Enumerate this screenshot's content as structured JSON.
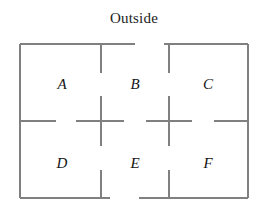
{
  "figure": {
    "type": "floor-plan-diagram",
    "width": 268,
    "height": 212,
    "background_color": "#ffffff",
    "title": "Outside",
    "wall_color": "#808080",
    "label_color": "#141414",
    "wall_thickness": 1.4
  },
  "rooms": [
    {
      "id": "A",
      "label": "A",
      "cx": 62,
      "cy": 84,
      "row": "top",
      "column": "left"
    },
    {
      "id": "B",
      "label": "B",
      "cx": 135,
      "cy": 84,
      "row": "top",
      "column": "center"
    },
    {
      "id": "C",
      "label": "C",
      "cx": 208,
      "cy": 84,
      "row": "top",
      "column": "right"
    },
    {
      "id": "D",
      "label": "D",
      "cx": 62,
      "cy": 163,
      "row": "bottom",
      "column": "left"
    },
    {
      "id": "E",
      "label": "E",
      "cx": 135,
      "cy": 163,
      "row": "bottom",
      "column": "center"
    },
    {
      "id": "F",
      "label": "F",
      "cx": 208,
      "cy": 163,
      "row": "bottom",
      "column": "right"
    }
  ],
  "geometry": {
    "outer_left": 20,
    "outer_right": 248,
    "outer_top": 44,
    "outer_bottom": 198,
    "divider_x_1": 101,
    "divider_x_2": 169,
    "divider_y": 121
  },
  "walls": [
    {
      "name": "outer-wall-left",
      "orientation": "vertical",
      "x1": 20,
      "y1": 44,
      "x2": 20,
      "y2": 198
    },
    {
      "name": "outer-wall-right",
      "orientation": "vertical",
      "x1": 248,
      "y1": 44,
      "x2": 248,
      "y2": 198
    },
    {
      "name": "outer-wall-top-left",
      "orientation": "horizontal",
      "x1": 20,
      "y1": 44,
      "x2": 135,
      "y2": 44
    },
    {
      "name": "outer-wall-top-right",
      "orientation": "horizontal",
      "x1": 164,
      "y1": 44,
      "x2": 248,
      "y2": 44
    },
    {
      "name": "outer-wall-bottom-left",
      "orientation": "horizontal",
      "x1": 20,
      "y1": 198,
      "x2": 110,
      "y2": 198
    },
    {
      "name": "outer-wall-bottom-right",
      "orientation": "horizontal",
      "x1": 139,
      "y1": 198,
      "x2": 248,
      "y2": 198
    },
    {
      "name": "inner-wall-mid-segment-1",
      "orientation": "horizontal",
      "x1": 20,
      "y1": 121,
      "x2": 56,
      "y2": 121
    },
    {
      "name": "inner-wall-mid-segment-2",
      "orientation": "horizontal",
      "x1": 76,
      "y1": 121,
      "x2": 124,
      "y2": 121
    },
    {
      "name": "inner-wall-mid-segment-3",
      "orientation": "horizontal",
      "x1": 146,
      "y1": 121,
      "x2": 192,
      "y2": 121
    },
    {
      "name": "inner-wall-mid-segment-4",
      "orientation": "horizontal",
      "x1": 214,
      "y1": 121,
      "x2": 248,
      "y2": 121
    },
    {
      "name": "inner-wall-ab-upper",
      "orientation": "vertical",
      "x1": 101,
      "y1": 44,
      "x2": 101,
      "y2": 73
    },
    {
      "name": "inner-wall-ab-lower",
      "orientation": "vertical",
      "x1": 101,
      "y1": 96,
      "x2": 101,
      "y2": 146
    },
    {
      "name": "inner-wall-de-lower",
      "orientation": "vertical",
      "x1": 101,
      "y1": 170,
      "x2": 101,
      "y2": 198
    },
    {
      "name": "inner-wall-bc-upper",
      "orientation": "vertical",
      "x1": 169,
      "y1": 44,
      "x2": 169,
      "y2": 73
    },
    {
      "name": "inner-wall-bc-lower",
      "orientation": "vertical",
      "x1": 169,
      "y1": 96,
      "x2": 169,
      "y2": 146
    },
    {
      "name": "inner-wall-ef-lower",
      "orientation": "vertical",
      "x1": 169,
      "y1": 170,
      "x2": 169,
      "y2": 198
    }
  ],
  "doorways": [
    {
      "name": "door-b-outside",
      "connects": [
        "B",
        "Outside"
      ],
      "orientation": "horizontal",
      "x1": 135,
      "y1": 44,
      "x2": 164,
      "y2": 44
    },
    {
      "name": "door-e-outside",
      "connects": [
        "E",
        "Outside"
      ],
      "orientation": "horizontal",
      "x1": 110,
      "y1": 198,
      "x2": 139,
      "y2": 198
    },
    {
      "name": "door-a-d",
      "connects": [
        "A",
        "D"
      ],
      "orientation": "horizontal",
      "x1": 56,
      "y1": 121,
      "x2": 76,
      "y2": 121
    },
    {
      "name": "door-b-e",
      "connects": [
        "B",
        "E"
      ],
      "orientation": "horizontal",
      "x1": 124,
      "y1": 121,
      "x2": 146,
      "y2": 121
    },
    {
      "name": "door-c-f",
      "connects": [
        "C",
        "F"
      ],
      "orientation": "horizontal",
      "x1": 192,
      "y1": 121,
      "x2": 214,
      "y2": 121
    },
    {
      "name": "door-a-b",
      "connects": [
        "A",
        "B"
      ],
      "orientation": "vertical",
      "x1": 101,
      "y1": 73,
      "x2": 101,
      "y2": 96
    },
    {
      "name": "door-d-e",
      "connects": [
        "D",
        "E"
      ],
      "orientation": "vertical",
      "x1": 101,
      "y1": 146,
      "x2": 101,
      "y2": 170
    },
    {
      "name": "door-b-c",
      "connects": [
        "B",
        "C"
      ],
      "orientation": "vertical",
      "x1": 169,
      "y1": 73,
      "x2": 169,
      "y2": 96
    },
    {
      "name": "door-e-f",
      "connects": [
        "E",
        "F"
      ],
      "orientation": "vertical",
      "x1": 169,
      "y1": 146,
      "x2": 169,
      "y2": 170
    }
  ]
}
